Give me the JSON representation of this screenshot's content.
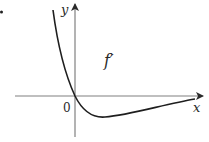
{
  "diagram": {
    "type": "function-graph",
    "axes": {
      "x_label": "x",
      "y_label": "y",
      "origin_label": "0"
    },
    "curve": {
      "label": "f′",
      "description": "Curve decreasing from upper left, passing through origin, reaching a minimum below the x-axis, then rising to approach the x-axis asymptotically from below"
    },
    "colors": {
      "axis": "#808080",
      "curve": "#1e1e1e",
      "text": "#2a2a2a"
    }
  }
}
